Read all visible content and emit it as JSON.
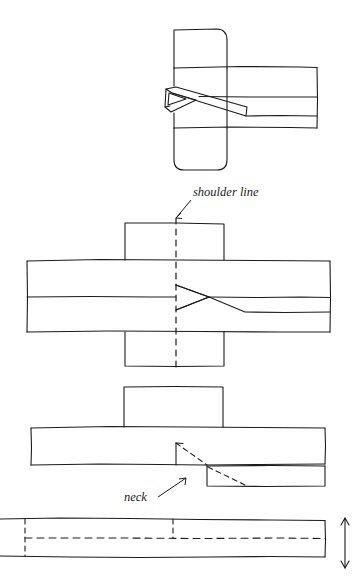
{
  "figure": {
    "title": "",
    "background_color": "#ffffff",
    "ink_color": "#1c1c1c",
    "stroke_width": 1.1,
    "width": 357,
    "height": 576,
    "style": "hand-drawn technical woodworking joint illustration"
  },
  "annotations": {
    "shoulder_line": {
      "text": "shoulder line",
      "x": 193,
      "y": 196,
      "arrow_from": [
        191,
        200
      ],
      "arrow_to": [
        175,
        219
      ]
    },
    "neck": {
      "text": "neck",
      "x": 124,
      "y": 500,
      "arrow_from": [
        160,
        496
      ],
      "arrow_to": [
        186,
        478
      ]
    }
  },
  "diagrams": [
    {
      "name": "top-view-joint-assembled",
      "description": "vertical post with rounded right corners crossed by horizontal rail with wedge key"
    },
    {
      "name": "middle-view-joint-shoulder",
      "description": "cross of post and rail with dashed shoulder line and dovetail wedge"
    },
    {
      "name": "third-view-neck-step",
      "description": "stepped rail profile with small block on top and dashed diagonal cut lines"
    },
    {
      "name": "bottom-view-stock-bar",
      "description": "long bar with dashed centerline and dashed division lines plus thickness arrow"
    }
  ],
  "markers": {
    "thickness_arrow": {
      "name": "thickness-double-arrow",
      "x": 345,
      "y_top": 518,
      "y_bottom": 568
    }
  }
}
